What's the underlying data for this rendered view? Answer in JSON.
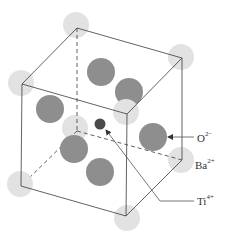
{
  "diagram": {
    "colors": {
      "background": "#ffffff",
      "ba_atom": "#e2e2e2",
      "o_atom": "#8e8e8e",
      "ti_atom": "#4a4a4a",
      "edge": "#3a3a3a",
      "leader": "#555555"
    },
    "cube_vertices": {
      "top_back_left": [
        77,
        28
      ],
      "top_back_right": [
        182,
        58
      ],
      "top_front_left": [
        22,
        84
      ],
      "top_front_right": [
        127,
        114
      ],
      "bottom_back_left": [
        77,
        131
      ],
      "bottom_back_right": [
        182,
        160
      ],
      "bottom_front_left": [
        21,
        186
      ],
      "bottom_front_right": [
        126,
        216
      ]
    },
    "ba_atoms": [
      {
        "name": "top-back-left",
        "cx": 76,
        "cy": 25,
        "r": 13
      },
      {
        "name": "top-back-right",
        "cx": 181,
        "cy": 57,
        "r": 13
      },
      {
        "name": "top-front-left",
        "cx": 21,
        "cy": 83,
        "r": 13
      },
      {
        "name": "top-front-right",
        "cx": 126,
        "cy": 112,
        "r": 13
      },
      {
        "name": "bottom-back-left",
        "cx": 75,
        "cy": 128,
        "r": 13
      },
      {
        "name": "bottom-back-right",
        "cx": 181,
        "cy": 160,
        "r": 13
      },
      {
        "name": "bottom-front-left",
        "cx": 20,
        "cy": 184,
        "r": 13
      },
      {
        "name": "bottom-front-right",
        "cx": 127,
        "cy": 218,
        "r": 13
      }
    ],
    "o_atoms": [
      {
        "name": "top-face",
        "cx": 101,
        "cy": 72,
        "r": 14
      },
      {
        "name": "back-face",
        "cx": 129,
        "cy": 92,
        "r": 14
      },
      {
        "name": "left-face",
        "cx": 50,
        "cy": 109,
        "r": 14
      },
      {
        "name": "right-face",
        "cx": 153,
        "cy": 137,
        "r": 14
      },
      {
        "name": "front-face",
        "cx": 74,
        "cy": 149,
        "r": 14
      },
      {
        "name": "bottom-face",
        "cx": 100,
        "cy": 172,
        "r": 14
      }
    ],
    "ti_atom": {
      "cx": 100,
      "cy": 124,
      "r": 5.5
    },
    "labels": {
      "oxygen": {
        "base": "O",
        "charge": "2−"
      },
      "barium": {
        "base": "Ba",
        "charge": "2+"
      },
      "titanium": {
        "base": "Ti",
        "charge": "4+"
      }
    }
  }
}
